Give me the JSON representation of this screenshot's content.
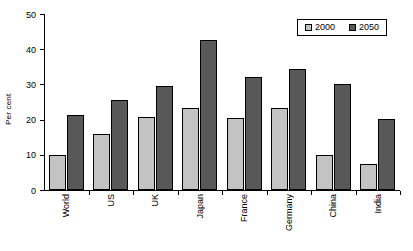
{
  "chart_data": {
    "type": "bar",
    "title": "",
    "xlabel": "",
    "ylabel": "Per cent",
    "ylim": [
      0,
      50
    ],
    "yticks": [
      0,
      10,
      20,
      30,
      40,
      50
    ],
    "grid": false,
    "legend_position": "top-right",
    "categories": [
      "World",
      "US",
      "UK",
      "Japan",
      "France",
      "Germany",
      "China",
      "India"
    ],
    "series": [
      {
        "name": "2000",
        "color": "#c3c3c3",
        "values": [
          10.0,
          16.0,
          20.8,
          23.2,
          20.5,
          23.2,
          10.0,
          7.5
        ]
      },
      {
        "name": "2050",
        "color": "#585858",
        "values": [
          21.3,
          25.5,
          29.5,
          42.5,
          32.2,
          34.5,
          30.0,
          20.2
        ]
      }
    ]
  }
}
